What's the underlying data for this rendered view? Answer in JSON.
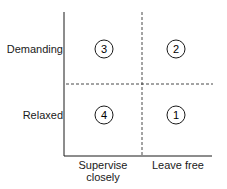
{
  "diagram": {
    "type": "2x2 matrix",
    "y_axis": {
      "labels": [
        "Demanding",
        "Relaxed"
      ]
    },
    "x_axis": {
      "labels": [
        "Supervise closely",
        "Leave free"
      ],
      "label_lines": [
        [
          "Supervise",
          "closely"
        ],
        [
          "Leave free"
        ]
      ]
    },
    "quadrants": [
      {
        "position": "top-left",
        "number": "3"
      },
      {
        "position": "top-right",
        "number": "2"
      },
      {
        "position": "bottom-left",
        "number": "4"
      },
      {
        "position": "bottom-right",
        "number": "1"
      }
    ],
    "colors": {
      "line": "#1a1a1a",
      "background": "#ffffff"
    }
  }
}
